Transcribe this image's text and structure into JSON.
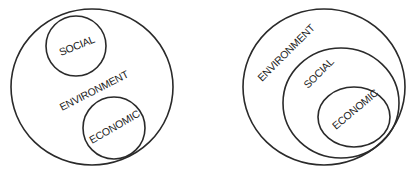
{
  "diagrams": [
    {
      "name": "overlapping-model",
      "labels": {
        "environment": "ENVIRONMENT",
        "social": "SOCIAL",
        "economic": "ECONOMIC"
      }
    },
    {
      "name": "nested-model",
      "labels": {
        "environment": "ENVIRONMENT",
        "social": "SOCIAL",
        "economic": "ECONOMIC"
      }
    }
  ],
  "colors": {
    "stroke": "#2a2a2a",
    "text": "#222222",
    "background": "#ffffff"
  }
}
